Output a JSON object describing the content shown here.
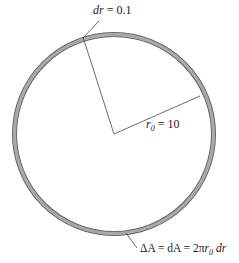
{
  "diagram": {
    "type": "annulus",
    "ring_color": "#a9a9a9",
    "ring_edge_color": "#555555",
    "line_color": "#444444",
    "labels": {
      "dr": {
        "var": "dr",
        "eq": " = 0.1"
      },
      "r0": {
        "var": "r",
        "sub": "0",
        "eq": " = 10"
      },
      "area": {
        "prefix": "ΔA = dA = 2π",
        "var": "r",
        "sub": "0",
        "tail": " dr"
      }
    }
  }
}
